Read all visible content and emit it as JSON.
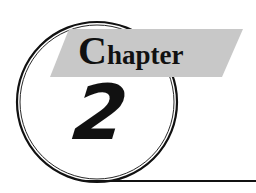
{
  "heading": {
    "label_first_letter": "C",
    "label_rest": "hapter",
    "number": "2"
  },
  "colors": {
    "banner": "#c8c8c8",
    "ink": "#111111",
    "background": "#ffffff"
  }
}
